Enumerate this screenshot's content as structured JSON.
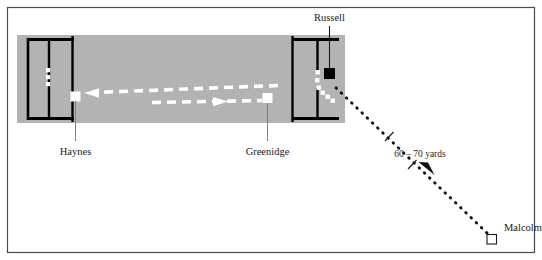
{
  "figure": {
    "type": "cricket-field-diagram",
    "title": "",
    "background_color": "#ffffff",
    "border_color": "#4c4c4c",
    "pitch_color": "#b3b3b3",
    "line_color": "#000000",
    "marker_white": "#ffffff",
    "marker_black": "#000000",
    "text_color": "#1a1a1a"
  },
  "labels": {
    "russell": "Russell",
    "haynes": "Haynes",
    "greenidge": "Greenidge",
    "malcolm": "Malcolm",
    "distance": "60 – 70 yards"
  },
  "players": [
    {
      "name": "Russell",
      "marker": "filled-square",
      "x": 330,
      "y": 74
    },
    {
      "name": "Haynes",
      "marker": "open-square",
      "x": 76,
      "y": 96
    },
    {
      "name": "Greenidge",
      "marker": "open-square",
      "x": 268,
      "y": 98
    },
    {
      "name": "Malcolm",
      "marker": "open-square",
      "x": 492,
      "y": 240
    }
  ],
  "annotations": [
    {
      "kind": "dotted-throw",
      "from": "Malcolm",
      "to": "Russell",
      "label": "60 – 70 yards"
    },
    {
      "kind": "dashed-run",
      "from": "Greenidge",
      "to": "Haynes",
      "direction": "right-to-left"
    },
    {
      "kind": "dashed-run",
      "from": "Haynes",
      "to": "Greenidge",
      "direction": "left-to-right"
    }
  ]
}
